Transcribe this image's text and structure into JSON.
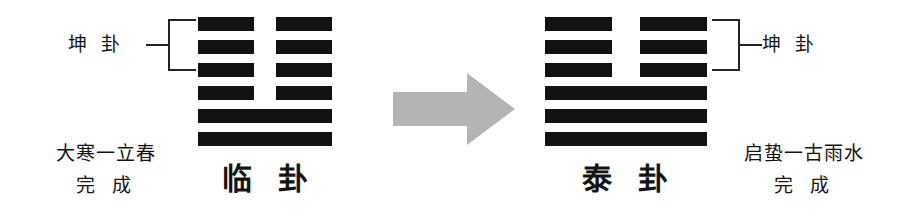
{
  "diagram": {
    "type": "hexagram-transformation",
    "background_color": "#ffffff",
    "ink_color": "#121212",
    "arrow_color": "#b4b4b4"
  },
  "left": {
    "trigram_label": "坤 卦",
    "hexagram_name": "临 卦",
    "terms_line1": "大寒一立春",
    "terms_line2": "完 成",
    "bracket_covers": "upper trigram (top 3 lines)",
    "lines_bottom_to_top": [
      "solid",
      "solid",
      "broken",
      "broken",
      "broken",
      "broken"
    ]
  },
  "right": {
    "trigram_label": "坤 卦",
    "hexagram_name": "泰 卦",
    "terms_line1": "启蛰一古雨水",
    "terms_line2": "完 成",
    "bracket_covers": "upper trigram (top 3 lines)",
    "lines_bottom_to_top": [
      "solid",
      "solid",
      "solid",
      "broken",
      "broken",
      "broken"
    ]
  },
  "arrow": {
    "icon": "right-arrow-icon",
    "direction": "right",
    "color": "#b4b4b4"
  }
}
